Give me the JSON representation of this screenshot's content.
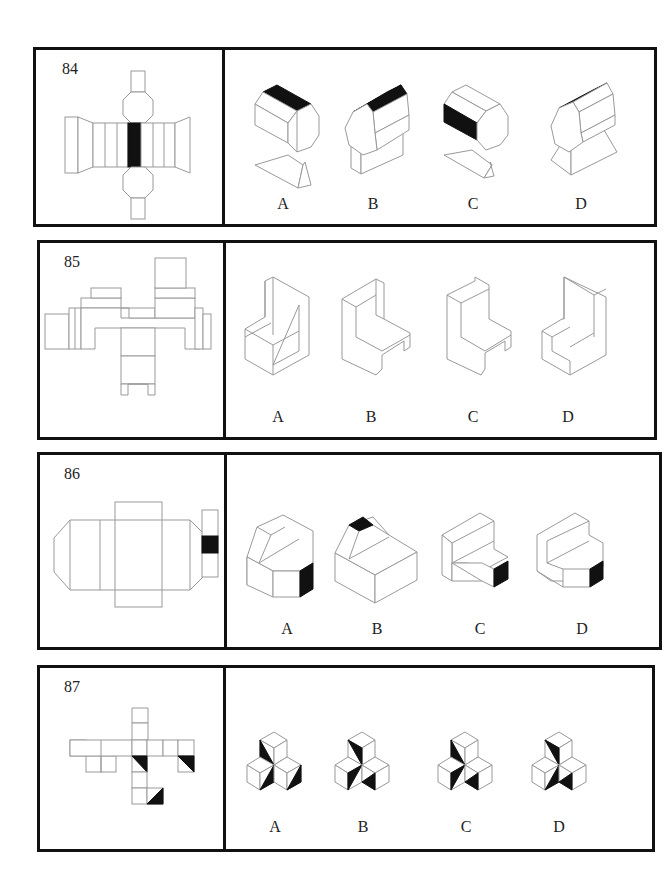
{
  "questions": [
    {
      "number": "84",
      "options": [
        {
          "label": "A"
        },
        {
          "label": "B"
        },
        {
          "label": "C"
        },
        {
          "label": "D"
        }
      ]
    },
    {
      "number": "85",
      "options": [
        {
          "label": "A"
        },
        {
          "label": "B"
        },
        {
          "label": "C"
        },
        {
          "label": "D"
        }
      ]
    },
    {
      "number": "86",
      "options": [
        {
          "label": "A"
        },
        {
          "label": "B"
        },
        {
          "label": "C"
        },
        {
          "label": "D"
        }
      ]
    },
    {
      "number": "87",
      "options": [
        {
          "label": "A"
        },
        {
          "label": "B"
        },
        {
          "label": "C"
        },
        {
          "label": "D"
        }
      ]
    }
  ],
  "colors": {
    "border": "#111111",
    "line": "#999999",
    "fill_dark": "#111111",
    "background": "#ffffff"
  }
}
